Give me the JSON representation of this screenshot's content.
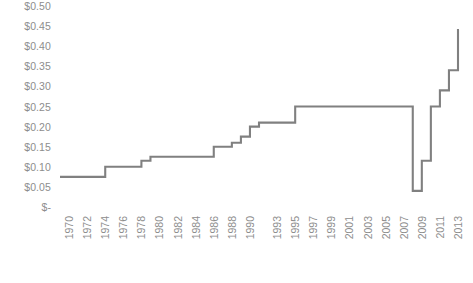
{
  "chart_data": {
    "type": "line",
    "title": "",
    "xlabel": "",
    "ylabel": "",
    "line_style": "step",
    "grid": false,
    "legend": "none",
    "line_color": "#808080",
    "ylim": [
      0,
      0.5
    ],
    "ytick_values": [
      0.5,
      0.45,
      0.4,
      0.35,
      0.3,
      0.25,
      0.2,
      0.15,
      0.1,
      0.05,
      0
    ],
    "ytick_labels": [
      "$0.50",
      "$0.45",
      "$0.40",
      "$0.35",
      "$0.30",
      "$0.25",
      "$0.20",
      "$0.15",
      "$0.10",
      "$0.05",
      "$-"
    ],
    "xtick_labels": [
      "1970",
      "1972",
      "1974",
      "1976",
      "1978",
      "1980",
      "1982",
      "1984",
      "1986",
      "1988",
      "1990",
      "1993",
      "1995",
      "1997",
      "1999",
      "2001",
      "2003",
      "2005",
      "2007",
      "2009",
      "2011",
      "2013"
    ],
    "x": [
      1970,
      1971,
      1972,
      1973,
      1974,
      1975,
      1976,
      1977,
      1978,
      1979,
      1980,
      1981,
      1982,
      1983,
      1984,
      1985,
      1986,
      1987,
      1988,
      1989,
      1990,
      1991,
      1992,
      1993,
      1994,
      1995,
      1996,
      1997,
      1998,
      1999,
      2000,
      2001,
      2002,
      2003,
      2004,
      2005,
      2006,
      2007,
      2008,
      2009,
      2010,
      2011,
      2012,
      2013,
      2014
    ],
    "values": [
      0.075,
      0.075,
      0.075,
      0.075,
      0.075,
      0.1,
      0.1,
      0.1,
      0.1,
      0.115,
      0.125,
      0.125,
      0.125,
      0.125,
      0.125,
      0.125,
      0.125,
      0.15,
      0.15,
      0.16,
      0.175,
      0.2,
      0.21,
      0.21,
      0.21,
      0.21,
      0.25,
      0.25,
      0.25,
      0.25,
      0.25,
      0.25,
      0.25,
      0.25,
      0.25,
      0.25,
      0.25,
      0.25,
      0.25,
      0.04,
      0.115,
      0.25,
      0.29,
      0.34,
      0.44
    ],
    "series_name": "Price per unit",
    "annotations": []
  },
  "axes": {
    "y_label_color": "#8d8d8d",
    "x_label_color": "#8d8d8d"
  }
}
